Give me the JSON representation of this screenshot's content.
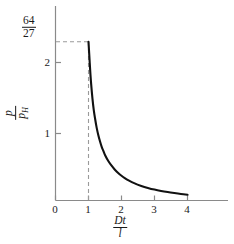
{
  "chart_data": {
    "type": "line",
    "title": "",
    "subtitle": "",
    "xlabel": "Dt / l",
    "xlabel_numerator": "Dt",
    "xlabel_denominator": "l",
    "ylabel": "p / p_H",
    "ylabel_numerator": "p",
    "ylabel_denominator": "p",
    "ylabel_denominator_sub": "H",
    "xlim": [
      0,
      5.15
    ],
    "ylim": [
      0,
      2.78
    ],
    "grid": false,
    "legend": null,
    "xticks": [
      "0",
      "1",
      "2",
      "3",
      "4"
    ],
    "xtick_values": [
      0,
      1,
      2,
      3,
      4
    ],
    "yticks": [
      "1",
      "2"
    ],
    "ytick_values": [
      1,
      2
    ],
    "special_ytick": {
      "label": "64/27",
      "numerator": "64",
      "denominator": "27",
      "value": 2.37
    },
    "annotations": [
      {
        "name": "horizontal-guide",
        "style": "dashed",
        "from": [
          0,
          2.37
        ],
        "to": [
          1,
          2.37
        ]
      },
      {
        "name": "vertical-guide",
        "style": "dashed",
        "from": [
          1,
          0
        ],
        "to": [
          1,
          2.37
        ]
      }
    ],
    "series": [
      {
        "name": "pressure-ratio",
        "color": "#111111",
        "line_width": 2.1,
        "x": [
          1.0,
          1.02,
          1.05,
          1.08,
          1.12,
          1.16,
          1.2,
          1.25,
          1.3,
          1.35,
          1.4,
          1.45,
          1.5,
          1.6,
          1.7,
          1.8,
          1.9,
          2.0,
          2.1,
          2.2,
          2.4,
          2.6,
          2.8,
          3.0,
          3.2,
          3.4,
          3.6,
          3.8,
          4.0
        ],
        "values": [
          2.37,
          2.2,
          1.95,
          1.74,
          1.52,
          1.35,
          1.22,
          1.08,
          0.97,
          0.88,
          0.8,
          0.74,
          0.68,
          0.59,
          0.52,
          0.46,
          0.41,
          0.37,
          0.335,
          0.305,
          0.255,
          0.218,
          0.188,
          0.163,
          0.143,
          0.126,
          0.111,
          0.097,
          0.085
        ]
      }
    ]
  },
  "axes": {
    "x_axis_name": "x-axis",
    "y_axis_name": "y-axis",
    "axis_color": "#8a8a8a",
    "dash_color": "#9a9a9a"
  }
}
